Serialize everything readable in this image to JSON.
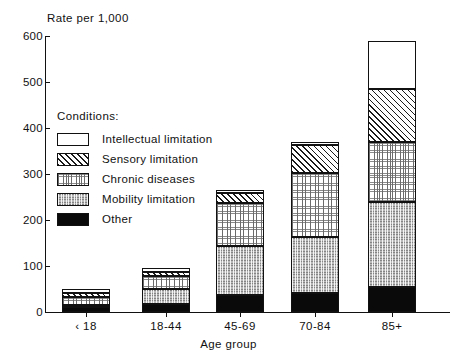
{
  "chart_data": {
    "type": "bar",
    "subtype": "stacked-bar",
    "title": "",
    "ylabel": "Rate per 1,000",
    "xlabel": "Age group",
    "categories": [
      "‹ 18",
      "18-44",
      "45-69",
      "70-84",
      "85+"
    ],
    "ylim": [
      0,
      600
    ],
    "yticks": [
      0,
      100,
      200,
      300,
      400,
      500,
      600
    ],
    "ytick_labels": [
      "0",
      "100",
      "200",
      "300",
      "400",
      "500",
      "600"
    ],
    "grid": false,
    "legend_position": "inside-upper-left",
    "legend_title": "Conditions:",
    "stack_order_bottom_to_top": [
      "Other",
      "Mobility limitation",
      "Chronic diseases",
      "Sensory limitation",
      "Intellectual limitation"
    ],
    "series": [
      {
        "name": "Other",
        "pattern": "solid-black",
        "values": [
          10,
          18,
          38,
          42,
          55
        ]
      },
      {
        "name": "Mobility limitation",
        "pattern": "checkered-gray",
        "values": [
          5,
          32,
          105,
          120,
          185
        ]
      },
      {
        "name": "Chronic diseases",
        "pattern": "fine-dots",
        "values": [
          18,
          28,
          95,
          140,
          130
        ]
      },
      {
        "name": "Sensory limitation",
        "pattern": "diagonal-hatch",
        "values": [
          9,
          10,
          20,
          60,
          115
        ]
      },
      {
        "name": "Intellectual limitation",
        "pattern": "empty-white",
        "values": [
          8,
          7,
          7,
          8,
          105
        ]
      }
    ],
    "totals": [
      50,
      95,
      265,
      370,
      590
    ]
  },
  "legend": {
    "title": "Conditions:",
    "items": [
      {
        "label": "Intellectual limitation",
        "pattern": "empty-white"
      },
      {
        "label": "Sensory limitation",
        "pattern": "diagonal-hatch"
      },
      {
        "label": "Chronic diseases",
        "pattern": "fine-dots"
      },
      {
        "label": "Mobility limitation",
        "pattern": "checkered-gray"
      },
      {
        "label": "Other",
        "pattern": "solid-black"
      }
    ]
  },
  "colors": {
    "axis": "#111111",
    "text": "#111111",
    "background": "#ffffff",
    "solid": "#0a0a0a",
    "checker": "#b9b9b9"
  }
}
